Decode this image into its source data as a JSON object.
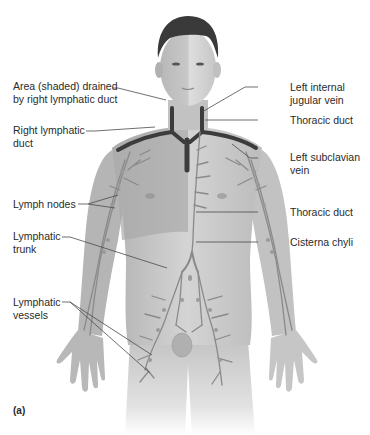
{
  "figure": {
    "panel_letter": "(a)",
    "colors": {
      "background": "#ffffff",
      "skin_light": "#d9d9d9",
      "skin_mid": "#bdbdbd",
      "skin_shade": "#a8a8a8",
      "hair": "#3a3a3a",
      "vessel": "#8a8a8a",
      "vein_dark": "#3c3c3c",
      "leader_line": "#4a4a4a",
      "text": "#2a2a2a"
    }
  },
  "labels": {
    "left_side": [
      {
        "id": "area-shaded",
        "text": "Area (shaded) drained\nby right lymphatic duct"
      },
      {
        "id": "right-lymphatic-duct",
        "text": "Right lymphatic\nduct"
      },
      {
        "id": "lymph-nodes",
        "text": "Lymph nodes"
      },
      {
        "id": "lymphatic-trunk",
        "text": "Lymphatic\ntrunk"
      },
      {
        "id": "lymphatic-vessels",
        "text": "Lymphatic\nvessels"
      }
    ],
    "right_side": [
      {
        "id": "left-internal-jugular-vein",
        "text": "Left internal\njugular vein"
      },
      {
        "id": "thoracic-duct-upper",
        "text": "Thoracic duct"
      },
      {
        "id": "left-subclavian-vein",
        "text": "Left subclavian\nvein"
      },
      {
        "id": "thoracic-duct-lower",
        "text": "Thoracic duct"
      },
      {
        "id": "cisterna-chyli",
        "text": "Cisterna chyli"
      }
    ]
  }
}
